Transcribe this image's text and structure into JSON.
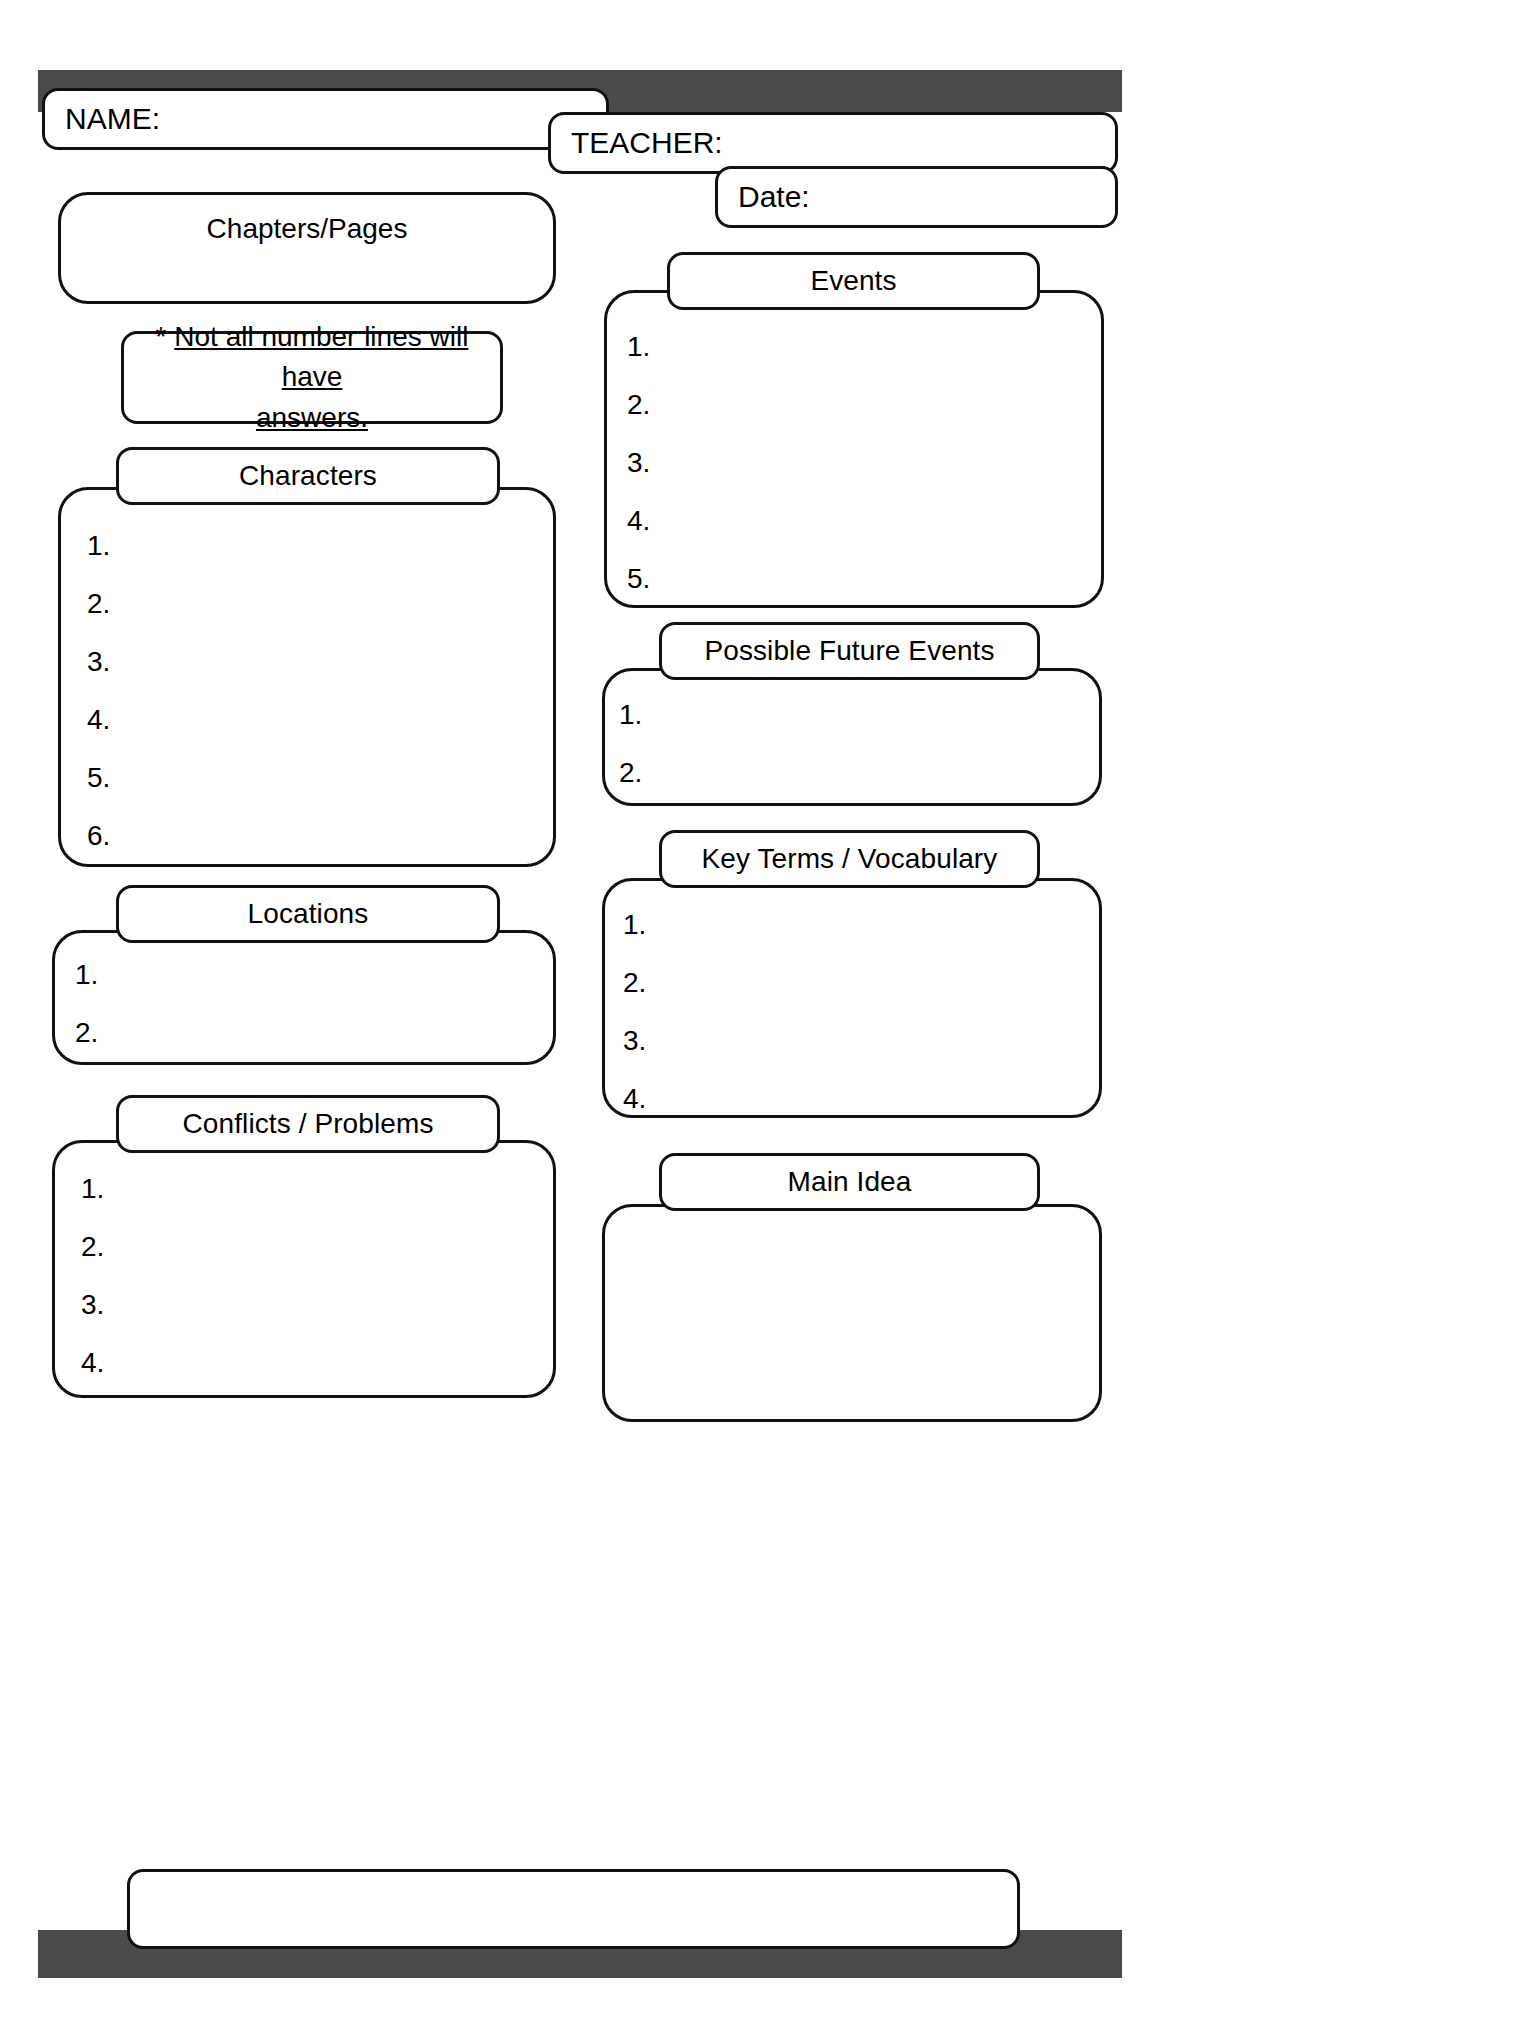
{
  "document": {
    "type": "reading-response-worksheet",
    "orientation": "portrait"
  },
  "colors": {
    "bar": "#4a4a4a",
    "stroke": "#111111",
    "fill": "#ffffff"
  },
  "header": {
    "name_label": "NAME:",
    "teacher_label": "TEACHER:",
    "date_label": "Date:"
  },
  "left_column": {
    "chapters": {
      "title": "Chapters/Pages"
    },
    "note": {
      "asterisk": "*",
      "line1": "Not all number lines will have",
      "line2": "answers."
    },
    "characters": {
      "title": "Characters",
      "items": [
        "1.",
        "2.",
        "3.",
        "4.",
        "5.",
        "6."
      ]
    },
    "locations": {
      "title": "Locations",
      "items": [
        "1.",
        "2."
      ]
    },
    "conflicts": {
      "title": "Conflicts / Problems",
      "items": [
        "1.",
        "2.",
        "3.",
        "4."
      ]
    }
  },
  "right_column": {
    "events": {
      "title": "Events",
      "items": [
        "1.",
        "2.",
        "3.",
        "4.",
        "5."
      ]
    },
    "future_events": {
      "title": "Possible Future Events",
      "items": [
        "1.",
        "2."
      ]
    },
    "key_terms": {
      "title": "Key Terms / Vocabulary",
      "items": [
        "1.",
        "2.",
        "3.",
        "4."
      ]
    },
    "main_idea": {
      "title": "Main Idea",
      "items": []
    }
  },
  "footer": {
    "note_box": ""
  }
}
